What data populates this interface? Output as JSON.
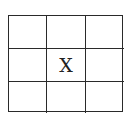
{
  "board": {
    "rows": 3,
    "cols": 3,
    "cells": [
      [
        "",
        "",
        ""
      ],
      [
        "",
        "X",
        ""
      ],
      [
        "",
        "",
        ""
      ]
    ]
  }
}
